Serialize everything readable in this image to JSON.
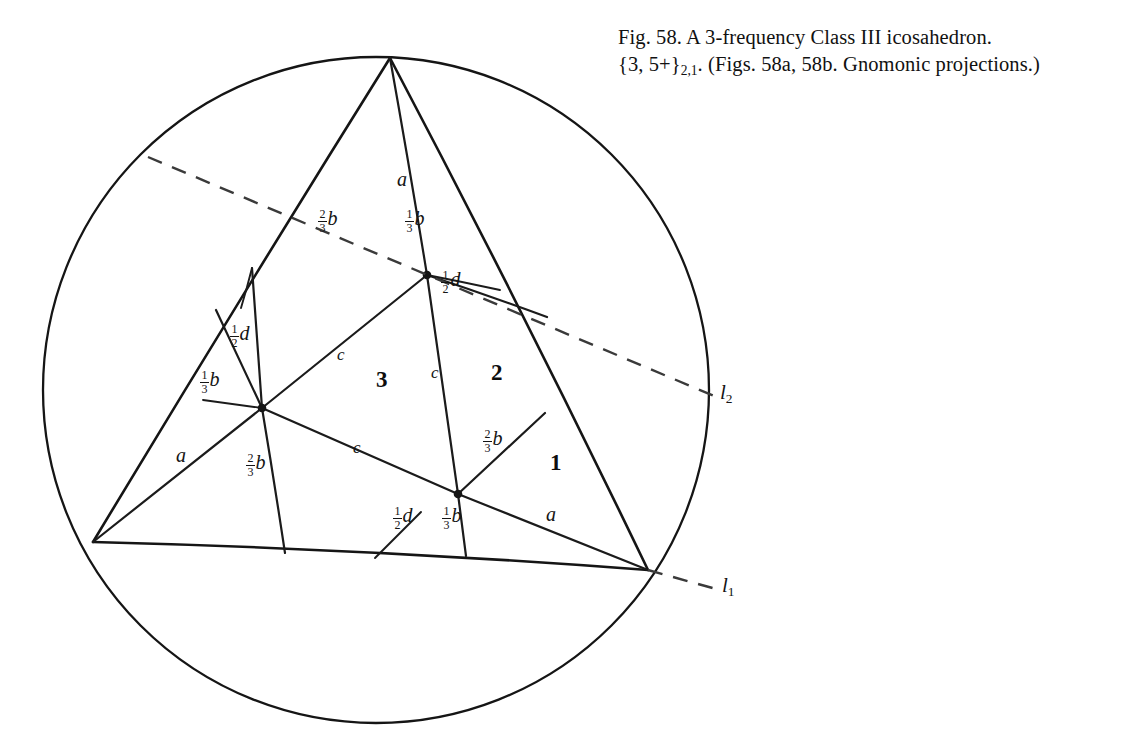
{
  "figure": {
    "caption_line_1": "Fig. 58. A 3-frequency Class III icosahedron.",
    "caption_line_2_a": "{3, 5+}",
    "caption_line_2_sub": "2,1",
    "caption_line_2_b": ". (Figs. 58a, 58b. Gnomonic projections.)",
    "caption_full": "Fig. 58. A 3-frequency Class III icosahedron. {3, 5+}2,1. (Figs. 58a, 58b. Gnomonic projections.)"
  },
  "colors": {
    "ink": "#151515",
    "dash": "#3a3a3a",
    "background": "#ffffff"
  },
  "diagram": {
    "circumcircle": {
      "cx": 376,
      "cy": 390,
      "r": 333
    },
    "triangle_vertices": [
      {
        "name": "apex",
        "x": 390,
        "y": 58
      },
      {
        "name": "left",
        "x": 93,
        "y": 542
      },
      {
        "name": "right",
        "x": 648,
        "y": 570
      }
    ],
    "internal_nodes": [
      {
        "name": "node-upper",
        "x": 427,
        "y": 275
      },
      {
        "name": "node-left",
        "x": 262,
        "y": 408
      },
      {
        "name": "node-lower-right",
        "x": 458,
        "y": 494
      }
    ],
    "dashed_lines": [
      {
        "name": "l1",
        "x1": 648,
        "y1": 570,
        "x2": 716,
        "y2": 589
      },
      {
        "name": "l2",
        "x1": 148,
        "y1": 157,
        "x2": 714,
        "y2": 396
      }
    ]
  },
  "labels": {
    "edge_letters": [
      {
        "id": "a-apex",
        "text": "a",
        "x": 401,
        "y": 178
      },
      {
        "id": "a-left",
        "text": "a",
        "x": 180,
        "y": 455
      },
      {
        "id": "a-right",
        "text": "a",
        "x": 551,
        "y": 513
      }
    ],
    "chord_letters": [
      {
        "id": "c-upper",
        "text": "c",
        "x": 341,
        "y": 353
      },
      {
        "id": "c-centre",
        "text": "c",
        "x": 434,
        "y": 371
      },
      {
        "id": "c-lower",
        "text": "c",
        "x": 357,
        "y": 446
      }
    ],
    "fractions": [
      {
        "id": "two-thirds-b-upper-left",
        "num": "2",
        "den": "3",
        "var": "b",
        "x": 324,
        "y": 218
      },
      {
        "id": "one-third-b-upper-right",
        "num": "1",
        "den": "3",
        "var": "b",
        "x": 411,
        "y": 218
      },
      {
        "id": "half-d-upper-right",
        "num": "1",
        "den": "2",
        "var": "d",
        "x": 447,
        "y": 278
      },
      {
        "id": "half-d-left",
        "num": "1",
        "den": "2",
        "var": "d",
        "x": 236,
        "y": 333
      },
      {
        "id": "one-third-b-left",
        "num": "1",
        "den": "3",
        "var": "b",
        "x": 206,
        "y": 379
      },
      {
        "id": "two-thirds-b-left-lower",
        "num": "2",
        "den": "3",
        "var": "b",
        "x": 252,
        "y": 462
      },
      {
        "id": "two-thirds-b-right",
        "num": "2",
        "den": "3",
        "var": "b",
        "x": 489,
        "y": 438
      },
      {
        "id": "half-d-bottom",
        "num": "1",
        "den": "2",
        "var": "d",
        "x": 399,
        "y": 515
      },
      {
        "id": "one-third-b-bottom",
        "num": "1",
        "den": "3",
        "var": "b",
        "x": 448,
        "y": 515
      }
    ],
    "regions": [
      {
        "id": "region-1",
        "text": "1",
        "x": 555,
        "y": 463
      },
      {
        "id": "region-2",
        "text": "2",
        "x": 497,
        "y": 373
      },
      {
        "id": "region-3",
        "text": "3",
        "x": 382,
        "y": 380
      }
    ],
    "lines": [
      {
        "id": "line-l1",
        "base": "l",
        "sub": "1",
        "x": 726,
        "y": 584
      },
      {
        "id": "line-l2",
        "base": "l",
        "sub": "2",
        "x": 724,
        "y": 391
      }
    ]
  }
}
